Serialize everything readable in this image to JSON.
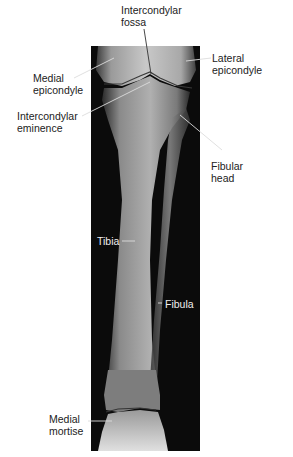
{
  "figure": {
    "type": "annotated radiograph",
    "labels": [
      {
        "id": "intercondylar-fossa",
        "lines": [
          "Intercondylar",
          "fossa"
        ]
      },
      {
        "id": "lateral-epicondyle",
        "lines": [
          "Lateral",
          "epicondyle"
        ]
      },
      {
        "id": "medial-epicondyle",
        "lines": [
          "Medial",
          "epicondyle"
        ]
      },
      {
        "id": "intercondylar-eminence",
        "lines": [
          "Intercondylar",
          "eminence"
        ]
      },
      {
        "id": "fibular-head",
        "lines": [
          "Fibular",
          "head"
        ]
      },
      {
        "id": "tibia",
        "lines": [
          "Tibia"
        ]
      },
      {
        "id": "fibula",
        "lines": [
          "Fibula"
        ]
      },
      {
        "id": "medial-mortise",
        "lines": [
          "Medial",
          "mortise"
        ]
      }
    ],
    "colors": {
      "background": "#ffffff",
      "xray_background": "#0a0a0a",
      "label_text": "#222222",
      "leader_line_dark": "#333333",
      "leader_line_light": "#dddddd"
    }
  }
}
